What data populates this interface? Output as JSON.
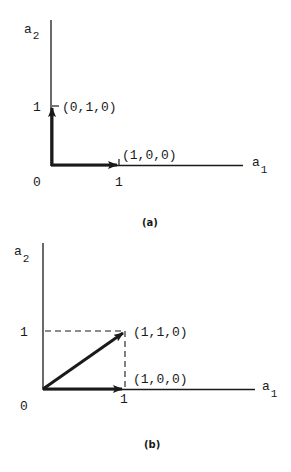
{
  "figure": {
    "panels": [
      {
        "caption": "(a)",
        "axes": {
          "x_label": "a",
          "x_sub": "1",
          "y_label": "a",
          "y_sub": "2"
        },
        "origin_label": "0",
        "x_tick_label": "1",
        "y_tick_label": "1",
        "vectors": [
          {
            "to": "(1,0,0)",
            "label": "(1,0,0)"
          },
          {
            "to": "(0,1,0)",
            "label": "(0,1,0)"
          }
        ]
      },
      {
        "caption": "(b)",
        "axes": {
          "x_label": "a",
          "x_sub": "1",
          "y_label": "a",
          "y_sub": "2"
        },
        "origin_label": "0",
        "x_tick_label": "1",
        "y_tick_label": "1",
        "vectors": [
          {
            "to": "(1,0,0)",
            "label": "(1,0,0)"
          },
          {
            "to": "(1,1,0)",
            "label": "(1,1,0)"
          }
        ],
        "guides": "dashed projection lines from (1,1,0) to both axes"
      }
    ],
    "colors": {
      "ink": "#1a1a1a",
      "background": "#ffffff"
    }
  }
}
